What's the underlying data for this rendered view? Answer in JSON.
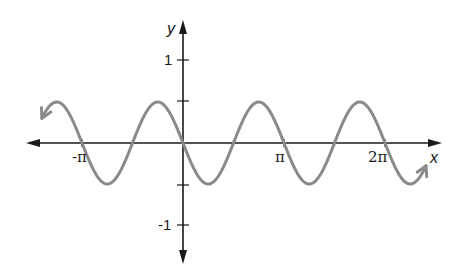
{
  "chart_data": {
    "type": "line",
    "title": "",
    "function": "y = -0.5 sin(2x)",
    "xlabel": "x",
    "ylabel": "y",
    "xlim": [
      -4.51,
      7.64
    ],
    "ylim": [
      -1.45,
      1.45
    ],
    "grid": false,
    "legend": null,
    "x_ticks": [
      {
        "value": -3.14159,
        "label": "-π"
      },
      {
        "value": 3.14159,
        "label": "π"
      },
      {
        "value": 6.28319,
        "label": "2π"
      }
    ],
    "x_minor_ticks": [
      -1.5708,
      1.5708,
      4.7124
    ],
    "y_ticks": [
      {
        "value": 1,
        "label": "1"
      },
      {
        "value": 0.5,
        "label": ""
      },
      {
        "value": -0.5,
        "label": ""
      },
      {
        "value": -1,
        "label": "-1"
      }
    ],
    "series": [
      {
        "name": "y = -0.5 sin(2x)",
        "color": "#8a8a8a",
        "amplitude": 0.5,
        "period": 3.14159,
        "x": [
          -4.51,
          -3.927,
          -3.14159,
          -2.356,
          -1.5708,
          -0.785,
          0,
          0.785,
          1.5708,
          2.356,
          3.14159,
          3.927,
          4.7124,
          5.498,
          6.28319,
          7.069,
          7.64
        ],
        "values": [
          -0.2,
          0.5,
          0,
          -0.5,
          0,
          0.5,
          0,
          -0.5,
          0,
          0.5,
          0,
          -0.5,
          0,
          0.5,
          0,
          -0.5,
          -0.2
        ]
      }
    ],
    "annotations": [
      "arrowheads at both ends of curve",
      "arrowheads at both ends of both axes"
    ]
  },
  "labels": {
    "x_axis": "x",
    "y_axis": "y",
    "neg_pi": "-π",
    "pi": "π",
    "two_pi": "2π",
    "y_one": "1",
    "y_neg_one": "-1"
  },
  "colors": {
    "curve": "#8a8a8a",
    "axes": "#1a1a1a"
  }
}
